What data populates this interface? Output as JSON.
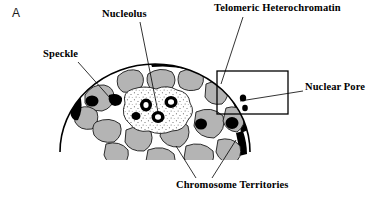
{
  "figure": {
    "panel_letter": "A",
    "labels": {
      "nucleolus": "Nucleolus",
      "telomeric_heterochromatin": "Telomeric Heterochromatin",
      "speckle": "Speckle",
      "nuclear_pore": "Nuclear Pore",
      "chromosome_territories": "Chromosome Territories"
    },
    "icons": {
      "nucleus_dome": "nucleus-dome-icon",
      "inset_box": "inset-box-icon"
    },
    "colors": {
      "background": "#ffffff",
      "outline": "#000000",
      "chromosome_territory_fill": "#b4b4b4",
      "heterochromatin_fill": "#000000",
      "speckle_fill": "#000000",
      "nucleolus_fill": "#ffffff",
      "nucleolus_stipple": "#555555",
      "interchromatin_space": "#ffffff",
      "label_text": "#000000"
    }
  }
}
